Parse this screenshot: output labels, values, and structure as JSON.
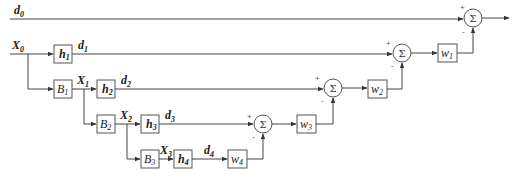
{
  "diagram": {
    "type": "block-diagram",
    "signals": {
      "d0": {
        "main": "d",
        "sub": "0"
      },
      "X0": {
        "main": "X",
        "sub": "0"
      },
      "d1": {
        "main": "d",
        "sub": "1"
      },
      "X1": {
        "main": "X",
        "sub": "1"
      },
      "d2": {
        "main": "d",
        "sub": "2"
      },
      "X2": {
        "main": "X",
        "sub": "2"
      },
      "d3": {
        "main": "d",
        "sub": "3"
      },
      "X3": {
        "main": "X",
        "sub": "3"
      },
      "d4": {
        "main": "d",
        "sub": "4"
      }
    },
    "blocks": {
      "h1": {
        "main": "h",
        "sub": "1"
      },
      "h2": {
        "main": "h",
        "sub": "2"
      },
      "h3": {
        "main": "h",
        "sub": "3"
      },
      "h4": {
        "main": "h",
        "sub": "4"
      },
      "B1": {
        "main": "B",
        "sub": "1"
      },
      "B2": {
        "main": "B",
        "sub": "2"
      },
      "B3": {
        "main": "B",
        "sub": "3"
      },
      "w1": {
        "main": "w",
        "sub": "1"
      },
      "w2": {
        "main": "w",
        "sub": "2"
      },
      "w3": {
        "main": "w",
        "sub": "3"
      },
      "w4": {
        "main": "w",
        "sub": "4"
      }
    },
    "summers": {
      "symbol": "Σ",
      "plus": "+",
      "minus": "-"
    }
  }
}
